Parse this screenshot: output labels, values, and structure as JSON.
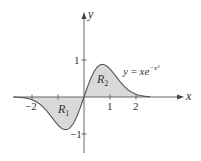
{
  "figure": {
    "function_label": {
      "lhs": "y",
      "eq": " = ",
      "base": "xe",
      "exponent": "−x²"
    },
    "axes": {
      "x_label": "x",
      "y_label": "y",
      "x_ticks": [
        {
          "value": -2,
          "label": "−2"
        },
        {
          "value": -1,
          "label": ""
        },
        {
          "value": 1,
          "label": "1"
        },
        {
          "value": 2,
          "label": "2"
        }
      ],
      "y_ticks": [
        {
          "value": 1,
          "label": "1"
        },
        {
          "value": -1,
          "label": "−1"
        }
      ]
    },
    "regions": [
      {
        "name": "R",
        "sub": "1",
        "description": "area between curve and x-axis for x < 0"
      },
      {
        "name": "R",
        "sub": "2",
        "description": "area between curve and x-axis for x > 0"
      }
    ],
    "colors": {
      "fill": "#d9d9d9",
      "curve": "#555555",
      "axis": "#666666",
      "text": "#333333"
    }
  }
}
